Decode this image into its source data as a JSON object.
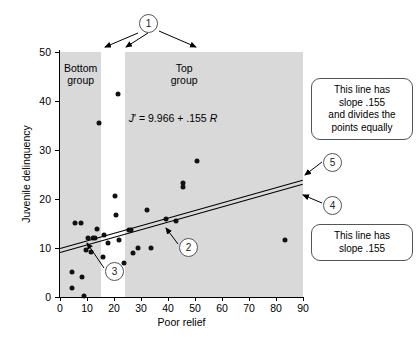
{
  "chart_data": {
    "type": "scatter",
    "title": "",
    "xlabel": "Poor relief",
    "ylabel": "Juvenile delinquency",
    "xlim": [
      0,
      90
    ],
    "ylim": [
      0,
      50
    ],
    "xticks": [
      0,
      10,
      20,
      30,
      40,
      50,
      60,
      70,
      80,
      90
    ],
    "yticks": [
      0,
      10,
      20,
      30,
      40,
      50
    ],
    "grid": false,
    "legend": "none",
    "points": [
      {
        "x": 4.5,
        "y": 5.1
      },
      {
        "x": 4.3,
        "y": 1.9
      },
      {
        "x": 5.5,
        "y": 15.1
      },
      {
        "x": 7.8,
        "y": 15.1
      },
      {
        "x": 8.3,
        "y": 4.0
      },
      {
        "x": 8.8,
        "y": 0.2
      },
      {
        "x": 9.6,
        "y": 9.6
      },
      {
        "x": 10.2,
        "y": 12.1
      },
      {
        "x": 11.4,
        "y": 9.2
      },
      {
        "x": 12.3,
        "y": 12.0
      },
      {
        "x": 13.0,
        "y": 12.1
      },
      {
        "x": 13.8,
        "y": 13.8
      },
      {
        "x": 14.6,
        "y": 35.6
      },
      {
        "x": 15.9,
        "y": 8.1
      },
      {
        "x": 16.4,
        "y": 12.6
      },
      {
        "x": 17.8,
        "y": 11.0
      },
      {
        "x": 20.3,
        "y": 20.7
      },
      {
        "x": 20.6,
        "y": 16.7
      },
      {
        "x": 21.5,
        "y": 41.5
      },
      {
        "x": 21.8,
        "y": 11.7
      },
      {
        "x": 23.6,
        "y": 6.9
      },
      {
        "x": 25.4,
        "y": 13.7
      },
      {
        "x": 26.4,
        "y": 13.6
      },
      {
        "x": 27.0,
        "y": 8.9
      },
      {
        "x": 28.9,
        "y": 9.9
      },
      {
        "x": 32.4,
        "y": 17.8
      },
      {
        "x": 33.8,
        "y": 9.9
      },
      {
        "x": 39.3,
        "y": 15.9
      },
      {
        "x": 42.9,
        "y": 15.6
      },
      {
        "x": 45.6,
        "y": 22.4
      },
      {
        "x": 45.6,
        "y": 23.2
      },
      {
        "x": 50.9,
        "y": 27.8
      },
      {
        "x": 83.3,
        "y": 11.7
      }
    ],
    "lines": [
      {
        "name": "best-fit-line",
        "slope": 0.155,
        "intercept": 9.966,
        "label": "J' = 9.966 + .155 R"
      },
      {
        "name": "equal-division-line",
        "slope": 0.155,
        "intercept": 9.25,
        "label": "This line has slope .155 and divides the points equally"
      }
    ],
    "bands": [
      {
        "name": "bottom-group",
        "label": "Bottom\ngroup",
        "x_start": 0,
        "x_end": 15.3,
        "color": "#d9d9d9"
      },
      {
        "name": "top-group",
        "label": "Top\ngroup",
        "x_start": 24.2,
        "x_end": 90,
        "color": "#d9d9d9"
      }
    ]
  },
  "axes": {
    "x_title": "Poor relief",
    "y_title": "Juvenile delinquency",
    "x_ticks": [
      "0",
      "10",
      "20",
      "30",
      "40",
      "50",
      "60",
      "70",
      "80",
      "90"
    ],
    "y_ticks": [
      "0",
      "10",
      "20",
      "30",
      "40",
      "50"
    ]
  },
  "bands": {
    "bottom": {
      "line1": "Bottom",
      "line2": "group"
    },
    "top": {
      "line1": "Top",
      "line2": "group"
    }
  },
  "equation": {
    "j": "J",
    "prime": "′",
    "body": " = 9.966 + .155 ",
    "r": "R",
    "full": "J′ = 9.966 + .155 R"
  },
  "callouts": {
    "circle1": "1",
    "circle2": "2",
    "circle3": "3",
    "circle4": "4",
    "circle5": "5",
    "box_top": "This line has slope .155 and divides the points equally",
    "box_top_lines": [
      "This line has",
      "slope .155",
      "and divides the",
      "points equally"
    ],
    "box_bottom": "This line has slope .155",
    "box_bottom_lines": [
      "This line has",
      "slope .155"
    ]
  },
  "colors": {
    "band": "#d9d9d9",
    "point": "#111111",
    "line": "#000000",
    "callout_border": "#555555",
    "background": "#ffffff"
  }
}
